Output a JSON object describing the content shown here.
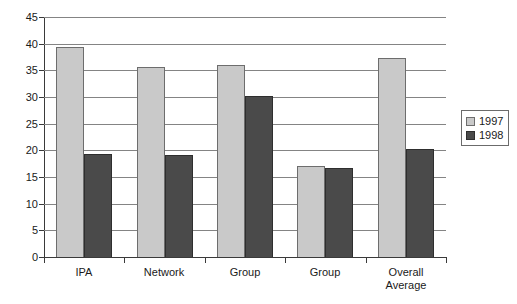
{
  "chart_data": {
    "type": "bar",
    "title": "",
    "subtitle": "",
    "xlabel": "",
    "ylabel": "",
    "categories": [
      "IPA",
      "Network",
      "Group",
      "Group",
      "Overall\nAverage"
    ],
    "series": [
      {
        "name": "1997",
        "color": "#c9c9c9",
        "values": [
          39.3,
          35.6,
          36.0,
          17.1,
          37.3
        ]
      },
      {
        "name": "1998",
        "color": "#4a4a4a",
        "values": [
          19.4,
          19.1,
          30.2,
          16.7,
          20.2
        ]
      }
    ],
    "ylim": [
      0,
      45
    ],
    "ytick_values": [
      0,
      5,
      10,
      15,
      20,
      25,
      30,
      35,
      40,
      45
    ],
    "ytick_labels": [
      "0",
      "5",
      "10",
      "15",
      "20",
      "25",
      "30",
      "35",
      "40",
      "45"
    ],
    "grid": true,
    "grid_axis": "y",
    "legend_position": "right",
    "legend_entries": [
      "1997",
      "1998"
    ],
    "bar_gap_within_group": 0,
    "axis_color": "#3a3a3a",
    "grid_color": "#848484",
    "background": "#ffffff"
  }
}
